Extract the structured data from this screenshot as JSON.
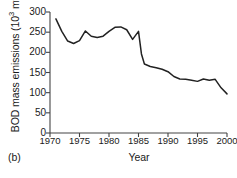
{
  "panel": {
    "label": "(b)"
  },
  "chart_data": {
    "type": "line",
    "title": "",
    "subtitle": "",
    "xlabel": "Year",
    "ylabel": "BOD mass emissions (10³ mt)",
    "ylabel_base": "BOD mass emissions (10",
    "ylabel_exponent": "3",
    "ylabel_tail": " mt)",
    "xlim": [
      1970,
      2000
    ],
    "ylim": [
      0,
      300
    ],
    "grid": false,
    "legend": false,
    "legend_position": "none",
    "line_color": "#222222",
    "background_color": "#ffffff",
    "xticks": [
      1970,
      1975,
      1980,
      1985,
      1990,
      1995,
      2000
    ],
    "xtick_labels": [
      "1970",
      "1975",
      "1980",
      "1985",
      "1990",
      "1995",
      "2000"
    ],
    "xminor_ticks": [
      1970,
      1975,
      1980,
      1985,
      1990,
      1995,
      2000
    ],
    "yticks": [
      0,
      50,
      100,
      150,
      200,
      250,
      300
    ],
    "ytick_labels": [
      "0",
      "50",
      "100",
      "150",
      "200",
      "250",
      "300"
    ],
    "series": [
      {
        "name": "BOD mass emissions",
        "x": [
          1971,
          1972,
          1973,
          1974,
          1975,
          1976,
          1977,
          1978,
          1979,
          1980,
          1981,
          1982,
          1983,
          1984,
          1985,
          1985.5,
          1986,
          1987,
          1988,
          1989,
          1990,
          1991,
          1992,
          1993,
          1994,
          1995,
          1996,
          1997,
          1998,
          1999,
          2000
        ],
        "values": [
          283,
          252,
          228,
          222,
          229,
          253,
          240,
          237,
          240,
          252,
          262,
          263,
          256,
          232,
          252,
          196,
          171,
          165,
          162,
          158,
          152,
          140,
          134,
          133,
          131,
          128,
          134,
          131,
          133,
          112,
          97
        ]
      }
    ]
  }
}
